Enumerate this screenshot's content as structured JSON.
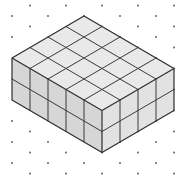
{
  "figure": {
    "cuboid": {
      "width_units": 4,
      "depth_units": 5,
      "height_units": 2,
      "total_cubes": 40
    }
  },
  "geometry": {
    "origin_top": [
      84,
      16
    ],
    "left_step": [
      -18,
      10.5
    ],
    "right_step": [
      18,
      10.5
    ],
    "height_step": 21
  },
  "dot_grid": {
    "x_step": 36,
    "half_x": 18,
    "y_step": 10.5,
    "x0": 12,
    "y0": 5.5,
    "radius": 0.9
  },
  "colors": {
    "background": "#ffffff",
    "top_face": "#e9e9e9",
    "left_face": "#d6d6d6",
    "right_face": "#e2e2e2",
    "edge": "#3a3a3a",
    "dot": "#555555"
  }
}
